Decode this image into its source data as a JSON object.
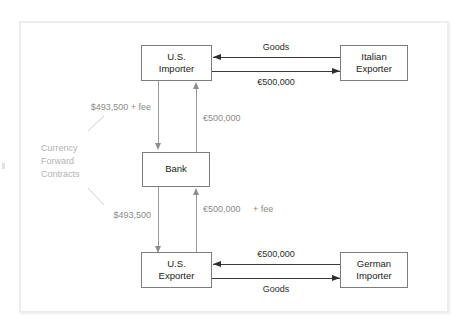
{
  "diagram": {
    "title": "Currency Forward Contracts",
    "nodes": {
      "us_importer": {
        "line1": "U.S.",
        "line2": "Importer"
      },
      "italian_exporter": {
        "line1": "Italian",
        "line2": "Exporter"
      },
      "bank": {
        "line1": "Bank"
      },
      "us_exporter": {
        "line1": "U.S.",
        "line2": "Exporter"
      },
      "german_importer": {
        "line1": "German",
        "line2": "Importer"
      }
    },
    "flows": {
      "goods_top": "Goods",
      "euros_top": "€500,000",
      "goods_bottom": "Goods",
      "euros_bottom": "€500,000",
      "importer_to_bank_line1": "$493,500",
      "importer_to_bank_line2": "+ fee",
      "bank_to_importer": "€500,000",
      "bank_to_exporter": "$493,500",
      "exporter_to_bank_line1": "€500,000",
      "exporter_to_bank_line2": "+ fee"
    },
    "group_label": {
      "line1": "Currency",
      "line2": "Forward",
      "line3": "Contracts"
    },
    "colors": {
      "node_border": "#7d7d7d",
      "node_text": "#1b1b1b",
      "goods_line": "#3a3a3a",
      "currency_line": "#9a9a9a",
      "label_gray": "#8b8b8b",
      "group_label_gray": "#b3b3b3",
      "frame": "#ededed"
    }
  }
}
